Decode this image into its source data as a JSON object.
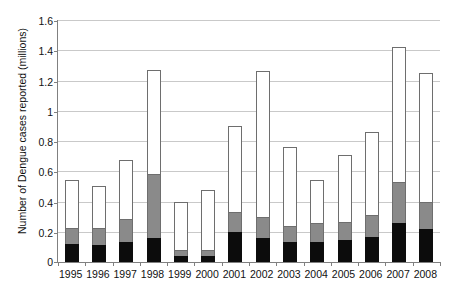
{
  "chart_data": {
    "type": "bar",
    "stacked": true,
    "title": "",
    "xlabel": "",
    "ylabel": "Number of Dengue cases reported (millions)",
    "ylim": [
      0,
      1.6
    ],
    "ytick_labels": [
      "0",
      "0.2",
      "0.4",
      "0.6",
      "0.8",
      "1",
      "1.2",
      "1.4",
      "1.6"
    ],
    "ytick_values": [
      0,
      0.2,
      0.4,
      0.6,
      0.8,
      1.0,
      1.2,
      1.4,
      1.6
    ],
    "grid": true,
    "legend": "none",
    "categories": [
      "1995",
      "1996",
      "1997",
      "1998",
      "1999",
      "2000",
      "2001",
      "2002",
      "2003",
      "2004",
      "2005",
      "2006",
      "2007",
      "2008"
    ],
    "series": [
      {
        "name": "black-segment",
        "color": "#0c0c0c",
        "values": [
          0.12,
          0.115,
          0.135,
          0.16,
          0.04,
          0.04,
          0.2,
          0.16,
          0.135,
          0.135,
          0.145,
          0.165,
          0.26,
          0.22
        ]
      },
      {
        "name": "gray-segment",
        "color": "#8a8a8a",
        "values": [
          0.105,
          0.11,
          0.15,
          0.42,
          0.04,
          0.04,
          0.13,
          0.14,
          0.105,
          0.125,
          0.12,
          0.145,
          0.27,
          0.18
        ]
      },
      {
        "name": "white-segment",
        "color": "#ffffff",
        "values": [
          0.315,
          0.28,
          0.39,
          0.69,
          0.32,
          0.395,
          0.57,
          0.96,
          0.52,
          0.285,
          0.44,
          0.55,
          0.89,
          0.85
        ]
      }
    ],
    "totals": [
      0.54,
      0.505,
      0.675,
      1.27,
      0.4,
      0.475,
      0.9,
      1.26,
      0.76,
      0.545,
      0.705,
      0.86,
      1.42,
      1.25
    ]
  }
}
